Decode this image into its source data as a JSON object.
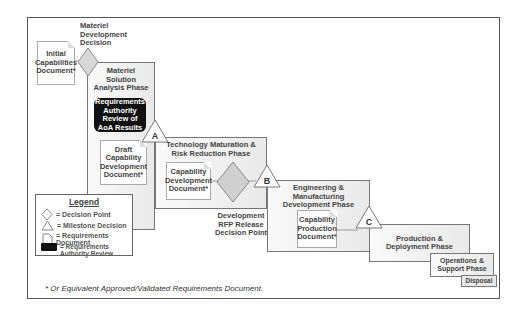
{
  "milestones": {
    "materiel_development_decision": "Materiel Development Decision",
    "a": "A",
    "b": "B",
    "c": "C",
    "development_rfp": "Development RFP Release Decision Point"
  },
  "phases": {
    "msa": "Materiel Solution Analysis Phase",
    "tmrr": "Technology Maturation & Risk Reduction Phase",
    "emd": "Engineering & Manufacturing Development Phase",
    "pd": "Production & Deployment Phase",
    "os": "Operations & Support Phase",
    "disposal": "Disposal"
  },
  "documents": {
    "icd": "Initial Capabilities Document*",
    "draft_cdd": "Draft Capability Development Document*",
    "cdd": "Capability Development Document*",
    "cpd": "Capability Production Document*"
  },
  "review": "Requirements Authority Review of AoA Results",
  "legend": {
    "title": "Legend",
    "decision_point": "= Decision Point",
    "milestone": "= Milestone Decision",
    "document": "= Requirements Document",
    "review": "= Requirements Authority Review"
  },
  "footnote": "* Or Equivalent Approved/Validated Requirements Document."
}
